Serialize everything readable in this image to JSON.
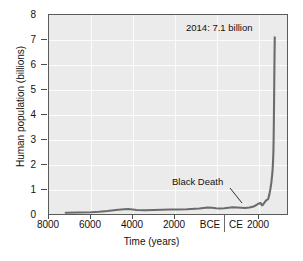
{
  "chart_data": {
    "type": "line",
    "title": "",
    "subtitle": "",
    "xlabel": "Time (years)",
    "ylabel": "Human population (billions)",
    "ylim": [
      0,
      8
    ],
    "yticks": [
      0,
      1,
      2,
      3,
      4,
      5,
      6,
      7,
      8
    ],
    "ytick_labels": [
      "0",
      "1",
      "2",
      "3",
      "4",
      "5",
      "6",
      "7",
      "8"
    ],
    "xlim": [
      -8800,
      2600
    ],
    "xticks": [
      -8000,
      -6000,
      -4000,
      -2000,
      0,
      2000
    ],
    "xtick_labels": [
      "8000",
      "6000",
      "4000",
      "2000",
      "BCE|CE",
      "2000"
    ],
    "era_labels": {
      "before": "BCE",
      "after": "CE",
      "divider_at_year": 0
    },
    "grid": true,
    "legend": null,
    "series": [
      {
        "name": "Human population",
        "color": "#6b6b6b",
        "x": [
          -8000,
          -7400,
          -6800,
          -6400,
          -6000,
          -5600,
          -5200,
          -5000,
          -4800,
          -4600,
          -4200,
          -3800,
          -3400,
          -3000,
          -2600,
          -2200,
          -2000,
          -1800,
          -1600,
          -1400,
          -1200,
          -1000,
          -800,
          -600,
          -400,
          -200,
          0,
          200,
          400,
          600,
          800,
          1000,
          1200,
          1300,
          1340,
          1400,
          1450,
          1500,
          1600,
          1700,
          1750,
          1800,
          1850,
          1900,
          1930,
          1950,
          1960,
          1970,
          1980,
          1990,
          2000,
          2014
        ],
        "y": [
          0.05,
          0.06,
          0.07,
          0.09,
          0.12,
          0.16,
          0.19,
          0.2,
          0.18,
          0.16,
          0.15,
          0.16,
          0.17,
          0.18,
          0.18,
          0.19,
          0.2,
          0.21,
          0.22,
          0.24,
          0.26,
          0.25,
          0.23,
          0.22,
          0.23,
          0.25,
          0.27,
          0.26,
          0.25,
          0.24,
          0.26,
          0.3,
          0.4,
          0.43,
          0.44,
          0.35,
          0.37,
          0.44,
          0.55,
          0.6,
          0.77,
          0.98,
          1.26,
          1.65,
          2.07,
          2.52,
          3.02,
          3.7,
          4.44,
          5.32,
          6.12,
          7.1
        ]
      }
    ],
    "annotations": [
      {
        "id": "peak",
        "text": "2014: 7.1 billion",
        "x": 2014,
        "y": 7.1
      },
      {
        "id": "black-death",
        "text": "Black Death",
        "x": 1350,
        "y": 0.37,
        "leader_line": true
      }
    ]
  },
  "axes": {
    "y_title": "Human population (billions)",
    "x_title": "Time (years)",
    "y_labels": [
      "8",
      "7",
      "6",
      "5",
      "4",
      "3",
      "2",
      "1",
      "0"
    ],
    "x_labels": [
      "8000",
      "6000",
      "4000",
      "2000",
      "BCE",
      "CE",
      "2000"
    ]
  },
  "annotations": {
    "peak_label": "2014: 7.1 billion",
    "event_label": "Black Death"
  },
  "colors": {
    "plot_background": "#ebebeb",
    "gridline": "#fbfbfb",
    "frame": "#5a5a5a",
    "curve": "#6b6b6b",
    "text": "#111111"
  }
}
